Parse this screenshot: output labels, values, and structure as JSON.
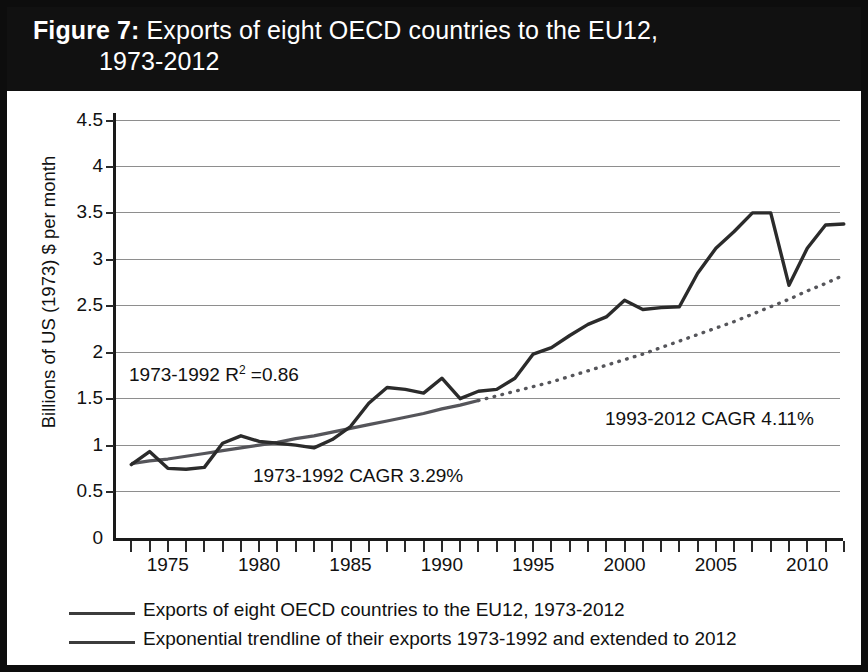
{
  "figure": {
    "label": "Figure 7:",
    "title_line1": "Exports of eight OECD countries to the EU12,",
    "title_line2": "1973-2012",
    "band_color": "#111111"
  },
  "axes": {
    "y_title": "Billions of US (1973) $ per month",
    "y_ticks": [
      "0",
      "0.5",
      "1",
      "1.5",
      "2",
      "2.5",
      "3",
      "3.5",
      "4",
      "4.5"
    ],
    "y_min": 0,
    "y_max": 4.5,
    "x_ticks_labeled": [
      "1975",
      "1980",
      "1985",
      "1990",
      "1995",
      "2000",
      "2005",
      "2010"
    ],
    "x_min": 1972,
    "x_max": 2012,
    "x_tick_step_years": 1,
    "grid": "horizontal"
  },
  "annotations": {
    "r_squared": {
      "prefix": "1973-1992 R",
      "sup": "2",
      "suffix": " =0.86",
      "full": "1973-1992 R2 =0.86"
    },
    "cagr_early": "1973-1992 CAGR 3.29%",
    "cagr_late": "1993-2012 CAGR 4.11%"
  },
  "legend": {
    "items": [
      {
        "label": "Exports of eight OECD countries to the EU12, 1973-2012",
        "color": "#3c3c3c",
        "style": "solid"
      },
      {
        "label": "Exponential trendline of their exports 1973-1992 and extended to 2012",
        "color": "#5a5a5a",
        "style": "solid"
      }
    ]
  },
  "colors": {
    "series_line": "#2b2b2b",
    "trendline": "#55555a",
    "grid": "#8e8e8e",
    "axis": "#1a1a1a",
    "background": "#ffffff",
    "frame": "#0d0d0d"
  },
  "chart_data": {
    "type": "line",
    "title": "Figure 7: Exports of eight OECD countries to the EU12, 1973-2012",
    "xlabel": "",
    "ylabel": "Billions of US (1973) $ per month",
    "xlim": [
      1972,
      2012
    ],
    "ylim": [
      0,
      4.5
    ],
    "grid": true,
    "legend_position": "bottom",
    "x": [
      1973,
      1974,
      1975,
      1976,
      1977,
      1978,
      1979,
      1980,
      1981,
      1982,
      1983,
      1984,
      1985,
      1986,
      1987,
      1988,
      1989,
      1990,
      1991,
      1992,
      1993,
      1994,
      1995,
      1996,
      1997,
      1998,
      1999,
      2000,
      2001,
      2002,
      2003,
      2004,
      2005,
      2006,
      2007,
      2008,
      2009,
      2010,
      2011,
      2012
    ],
    "series": [
      {
        "name": "Exports of eight OECD countries to the EU12, 1973-2012",
        "style": "solid",
        "color": "#2b2b2b",
        "values": [
          0.79,
          0.93,
          0.75,
          0.74,
          0.76,
          1.02,
          1.1,
          1.04,
          1.02,
          1.0,
          0.97,
          1.06,
          1.2,
          1.45,
          1.62,
          1.6,
          1.56,
          1.72,
          1.5,
          1.58,
          1.6,
          1.72,
          1.98,
          2.05,
          2.18,
          2.3,
          2.38,
          2.56,
          2.46,
          2.48,
          2.49,
          2.85,
          3.12,
          3.3,
          3.5,
          3.5,
          2.72,
          3.12,
          3.37,
          3.38
        ]
      },
      {
        "name": "Exponential trendline of their exports 1973-1992 and extended to 2012",
        "style": "solid 1973-1992, dotted 1993-2012",
        "color": "#55555a",
        "cagr_fitted_pct": 3.29,
        "r_squared": 0.86,
        "values": [
          0.8,
          0.83,
          0.85,
          0.88,
          0.91,
          0.94,
          0.97,
          1.0,
          1.03,
          1.07,
          1.1,
          1.14,
          1.18,
          1.22,
          1.26,
          1.3,
          1.34,
          1.39,
          1.43,
          1.48,
          1.53,
          1.58,
          1.63,
          1.68,
          1.74,
          1.8,
          1.86,
          1.92,
          1.98,
          2.05,
          2.12,
          2.19,
          2.26,
          2.33,
          2.41,
          2.49,
          2.57,
          2.66,
          2.74,
          2.83
        ]
      }
    ],
    "annotations": [
      {
        "text": "1973-1992 R2 =0.86",
        "x": 1973.5,
        "y": 1.87
      },
      {
        "text": "1973-1992 CAGR 3.29%",
        "x": 1980.0,
        "y": 0.78
      },
      {
        "text": "1993-2012 CAGR 4.11%",
        "x": 1999.5,
        "y": 1.4
      }
    ]
  }
}
